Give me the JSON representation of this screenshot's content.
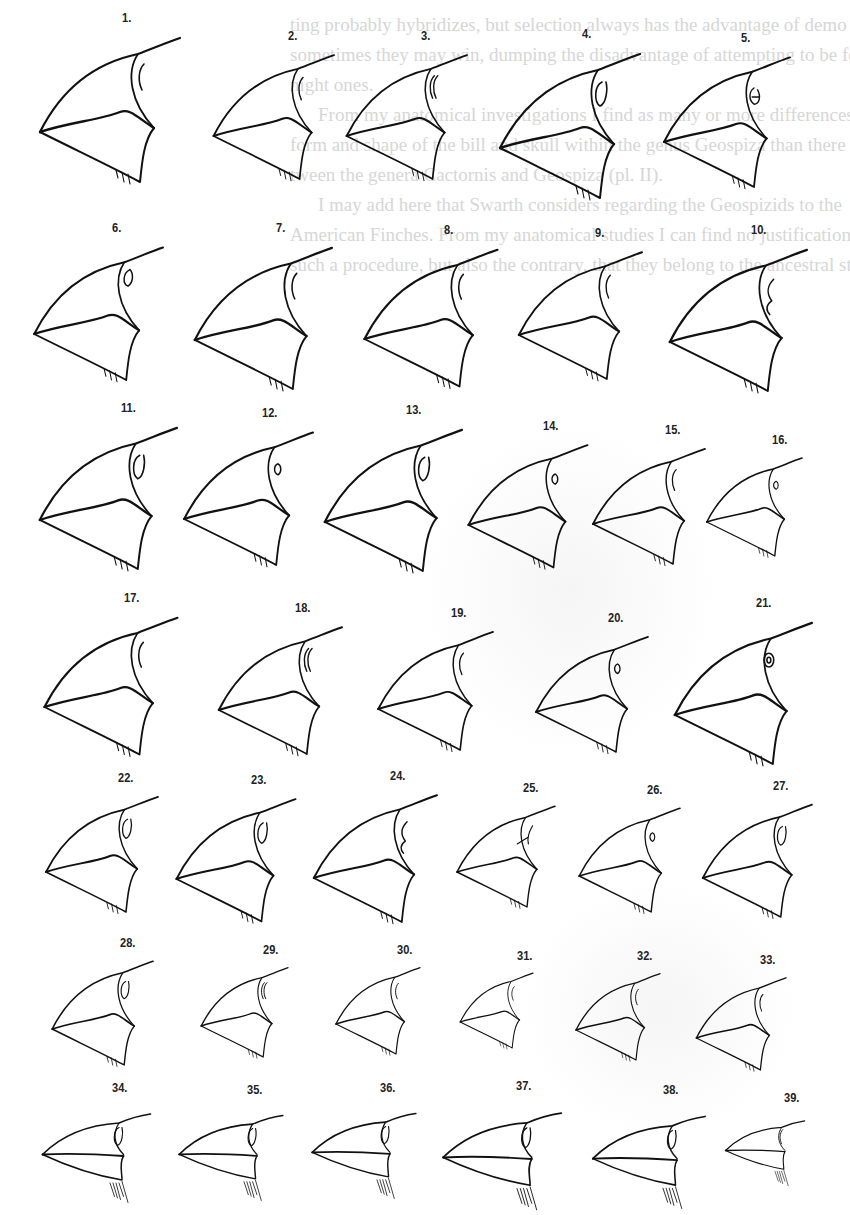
{
  "page": {
    "background": "#ffffff",
    "ink": "#111111",
    "bleed_color": "#d6d6d6"
  },
  "bleed_through_text": [
    "ting probably hybridizes, but selection always has the advantage of demo",
    "sometimes they may win, dumping the disadvantage of attempting to be feasi",
    "night ones.",
    "From my anatomical investigations I find as many or more differences in",
    "form and shape of the bill and skull within the genus Geospiza than there",
    "tween the genera Cactornis and Geospiza (pl. II).",
    "I may add here that Swarth considers regarding the Geospizids to the",
    "American Finches. From my anatomical studies I can find no justification for",
    "such a procedure, but also the contrary, that they belong to the ancestral stocks"
  ],
  "plate": {
    "title": "Beaks of Geospizinae, figures 1–39",
    "figures": [
      {
        "n": "1.",
        "x": 30,
        "y": 10,
        "s": 1.0,
        "eye": "ridge"
      },
      {
        "n": "2.",
        "x": 205,
        "y": 28,
        "s": 0.86,
        "eye": "ridge"
      },
      {
        "n": "3.",
        "x": 338,
        "y": 28,
        "s": 0.86,
        "eye": "ridge2"
      },
      {
        "n": "4.",
        "x": 490,
        "y": 26,
        "s": 1.0,
        "eye": "oval"
      },
      {
        "n": "5.",
        "x": 655,
        "y": 30,
        "s": 0.9,
        "eye": "double"
      },
      {
        "n": "6.",
        "x": 25,
        "y": 220,
        "s": 0.92,
        "eye": "loop"
      },
      {
        "n": "7.",
        "x": 185,
        "y": 220,
        "s": 0.98,
        "eye": "ridge"
      },
      {
        "n": "8.",
        "x": 355,
        "y": 222,
        "s": 0.95,
        "eye": "ridge"
      },
      {
        "n": "9.",
        "x": 510,
        "y": 225,
        "s": 0.88,
        "eye": "ridge"
      },
      {
        "n": "10.",
        "x": 660,
        "y": 222,
        "s": 0.98,
        "eye": "notch"
      },
      {
        "n": "11.",
        "x": 30,
        "y": 400,
        "s": 0.98,
        "eye": "oval"
      },
      {
        "n": "12.",
        "x": 175,
        "y": 405,
        "s": 0.92,
        "eye": "small"
      },
      {
        "n": "13.",
        "x": 315,
        "y": 402,
        "s": 0.98,
        "eye": "oval"
      },
      {
        "n": "14.",
        "x": 460,
        "y": 418,
        "s": 0.85,
        "eye": "small"
      },
      {
        "n": "15.",
        "x": 585,
        "y": 422,
        "s": 0.8,
        "eye": "ridge"
      },
      {
        "n": "16.",
        "x": 700,
        "y": 432,
        "s": 0.68,
        "eye": "small"
      },
      {
        "n": "17.",
        "x": 35,
        "y": 590,
        "s": 0.95,
        "eye": "ridge"
      },
      {
        "n": "18.",
        "x": 210,
        "y": 600,
        "s": 0.88,
        "eye": "ridge2"
      },
      {
        "n": "19.",
        "x": 370,
        "y": 605,
        "s": 0.82,
        "eye": "ridge"
      },
      {
        "n": "20.",
        "x": 528,
        "y": 610,
        "s": 0.8,
        "eye": "small"
      },
      {
        "n": "21.",
        "x": 665,
        "y": 595,
        "s": 0.98,
        "eye": "ring"
      },
      {
        "n": "22.",
        "x": 38,
        "y": 770,
        "s": 0.8,
        "eye": "oval"
      },
      {
        "n": "23.",
        "x": 168,
        "y": 772,
        "s": 0.85,
        "eye": "oval"
      },
      {
        "n": "24.",
        "x": 305,
        "y": 768,
        "s": 0.88,
        "eye": "notch"
      },
      {
        "n": "25.",
        "x": 450,
        "y": 780,
        "s": 0.7,
        "eye": "branch"
      },
      {
        "n": "26.",
        "x": 572,
        "y": 782,
        "s": 0.72,
        "eye": "small"
      },
      {
        "n": "27.",
        "x": 695,
        "y": 778,
        "s": 0.78,
        "eye": "oval"
      },
      {
        "n": "28.",
        "x": 45,
        "y": 935,
        "s": 0.72,
        "eye": "oval"
      },
      {
        "n": "29.",
        "x": 195,
        "y": 942,
        "s": 0.62,
        "eye": "ridge2"
      },
      {
        "n": "30.",
        "x": 330,
        "y": 942,
        "s": 0.6,
        "eye": "ridge"
      },
      {
        "n": "31.",
        "x": 455,
        "y": 948,
        "s": 0.52,
        "eye": "ridge"
      },
      {
        "n": "32.",
        "x": 570,
        "y": 948,
        "s": 0.6,
        "eye": "ridge"
      },
      {
        "n": "33.",
        "x": 690,
        "y": 952,
        "s": 0.64,
        "eye": "ridge"
      },
      {
        "n": "34.",
        "x": 35,
        "y": 1080,
        "s": 0.75,
        "eye": "oval",
        "flat": true
      },
      {
        "n": "35.",
        "x": 172,
        "y": 1082,
        "s": 0.72,
        "eye": "oval",
        "flat": true
      },
      {
        "n": "36.",
        "x": 305,
        "y": 1080,
        "s": 0.72,
        "eye": "oval",
        "flat": true
      },
      {
        "n": "37.",
        "x": 435,
        "y": 1078,
        "s": 0.82,
        "eye": "oval",
        "flat": true
      },
      {
        "n": "38.",
        "x": 585,
        "y": 1082,
        "s": 0.78,
        "eye": "oval",
        "flat": true
      },
      {
        "n": "39.",
        "x": 720,
        "y": 1090,
        "s": 0.55,
        "eye": "ridge",
        "flat": true
      }
    ]
  }
}
